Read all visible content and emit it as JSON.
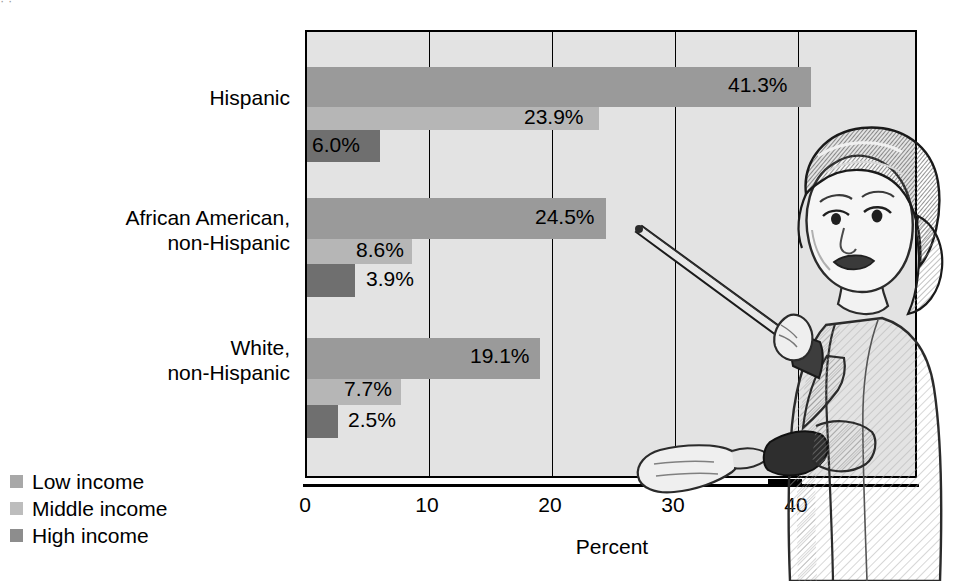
{
  "figure": {
    "top_sliver_text": "·                                           ·"
  },
  "chart_data": {
    "type": "bar",
    "orientation": "horizontal",
    "title": "",
    "xlabel": "Percent",
    "ylabel": "",
    "xlim": [
      0,
      50
    ],
    "xticks": [
      "0",
      "10",
      "20",
      "30",
      "40"
    ],
    "xtick_values": [
      0,
      10,
      20,
      30,
      40
    ],
    "grid": "vertical",
    "legend_position": "bottom-left-outside",
    "categories": [
      "Hispanic",
      "African American, non-Hispanic",
      "White, non-Hispanic"
    ],
    "series": [
      {
        "name": "Low income",
        "color": "#9a9a9a",
        "values": [
          41.3,
          24.5,
          19.1
        ],
        "labels": [
          "41.3%",
          "24.5%",
          "19.1%"
        ]
      },
      {
        "name": "Middle income",
        "color": "#b6b6b6",
        "values": [
          23.9,
          8.6,
          7.7
        ],
        "labels": [
          "23.9%",
          "8.6%",
          "7.7%"
        ]
      },
      {
        "name": "High income",
        "color": "#6f6f6f",
        "values": [
          6.0,
          3.9,
          2.5
        ],
        "labels": [
          "6.0%",
          "3.9%",
          "2.5%"
        ]
      }
    ]
  },
  "axis": {
    "title": "Percent",
    "ticks": [
      {
        "label": "0",
        "left": 305
      },
      {
        "label": "10",
        "left": 427
      },
      {
        "label": "20",
        "left": 550
      },
      {
        "label": "30",
        "left": 673
      },
      {
        "label": "40",
        "left": 796
      }
    ]
  },
  "category_labels": [
    {
      "line1": "Hispanic",
      "line2": "",
      "top": 86
    },
    {
      "line1": "African American,",
      "line2": "non-Hispanic",
      "top": 206
    },
    {
      "line1": "White,",
      "line2": "non-Hispanic",
      "top": 336
    }
  ],
  "bars": [
    {
      "group": "Hispanic",
      "series": "Low income",
      "label": "41.3%",
      "top": 65,
      "height": 40,
      "width": 504,
      "label_left": 728,
      "label_top": 74,
      "label_inside": true
    },
    {
      "group": "Hispanic",
      "series": "Middle income",
      "label": "23.9%",
      "top": 105,
      "height": 23,
      "width": 292,
      "label_left": 524,
      "label_top": 106,
      "label_inside": true
    },
    {
      "group": "Hispanic",
      "series": "High income",
      "label": "6.0%",
      "top": 128,
      "height": 32,
      "width": 73,
      "label_left": 312,
      "label_top": 134,
      "label_inside": true
    },
    {
      "group": "African American, non-Hispanic",
      "series": "Low income",
      "label": "24.5%",
      "top": 196,
      "height": 41,
      "width": 299,
      "label_left": 535,
      "label_top": 206,
      "label_inside": true
    },
    {
      "group": "African American, non-Hispanic",
      "series": "Middle income",
      "label": "8.6%",
      "top": 237,
      "height": 25,
      "width": 105,
      "label_left": 356,
      "label_top": 239,
      "label_inside": true
    },
    {
      "group": "African American, non-Hispanic",
      "series": "High income",
      "label": "3.9%",
      "top": 262,
      "height": 33,
      "width": 48,
      "label_left": 366,
      "label_top": 268,
      "label_inside": false
    },
    {
      "group": "White, non-Hispanic",
      "series": "Low income",
      "label": "19.1%",
      "top": 336,
      "height": 41,
      "width": 233,
      "label_left": 470,
      "label_top": 345,
      "label_inside": true
    },
    {
      "group": "White, non-Hispanic",
      "series": "Middle income",
      "label": "7.7%",
      "top": 377,
      "height": 26,
      "width": 94,
      "label_left": 344,
      "label_top": 378,
      "label_inside": true
    },
    {
      "group": "White, non-Hispanic",
      "series": "High income",
      "label": "2.5%",
      "top": 403,
      "height": 33,
      "width": 31,
      "label_left": 348,
      "label_top": 409,
      "label_inside": false
    }
  ],
  "gridlines": [
    122,
    245,
    368,
    491
  ],
  "legend": {
    "items": [
      {
        "label": "Low income",
        "swatch": "low",
        "color": "#a8a8a8"
      },
      {
        "label": "Middle income",
        "swatch": "middle",
        "color": "#bdbdbd"
      },
      {
        "label": "High income",
        "swatch": "high",
        "color": "#8d8d8d"
      }
    ]
  },
  "illustration": {
    "name": "woman-with-pointer-illustration",
    "description": "Line-art drawing of a woman holding a pointer stick at a chalkboard"
  }
}
